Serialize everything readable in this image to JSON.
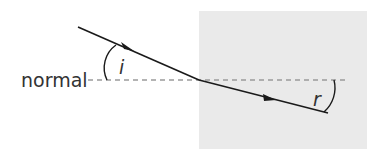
{
  "diagram": {
    "labels": {
      "normal": "normal",
      "incidence_angle": "i",
      "refraction_angle": "r"
    },
    "colors": {
      "medium": "#eaeaea",
      "ray": "#1a1a1a",
      "normal_line": "#9a9a9a",
      "text": "#333333"
    }
  }
}
